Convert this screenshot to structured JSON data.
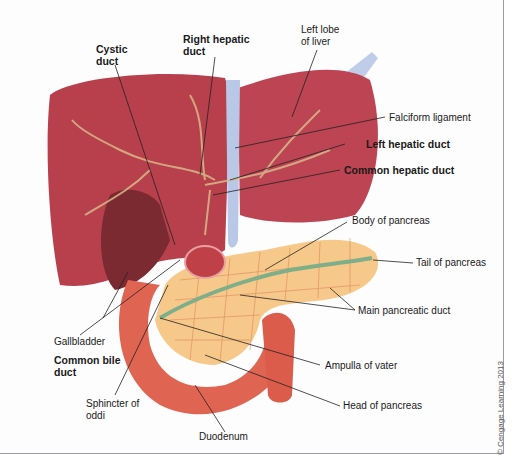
{
  "diagram": {
    "colors": {
      "liver": "#b8404c",
      "liver_dark": "#8e2a36",
      "gallbladder": "#7a2a30",
      "ligament": "#b9c8e6",
      "pancreas": "#f6c98a",
      "pancreas_lobule_line": "#e0805a",
      "duct": "#7fae8a",
      "duodenum": "#e06452",
      "vessel": "#d8b98a",
      "label_text": "#1a1a1a"
    },
    "labels": {
      "cystic_duct": "Cystic\nduct",
      "cystic_duct_l1": "Cystic",
      "cystic_duct_l2": "duct",
      "right_hepatic_duct_l1": "Right hepatic",
      "right_hepatic_duct_l2": "duct",
      "left_lobe_l1": "Left lobe",
      "left_lobe_l2": "of liver",
      "falciform_ligament": "Falciform ligament",
      "left_hepatic_duct": "Left hepatic duct",
      "common_hepatic_duct": "Common hepatic duct",
      "body_of_pancreas": "Body of pancreas",
      "tail_of_pancreas": "Tail of pancreas",
      "main_pancreatic_duct": "Main pancreatic duct",
      "gallbladder": "Gallbladder",
      "common_bile_duct_l1": "Common bile",
      "common_bile_duct_l2": "duct",
      "ampulla_of_vater": "Ampulla of vater",
      "sphincter_l1": "Sphincter of",
      "sphincter_l2": "oddi",
      "head_of_pancreas": "Head of pancreas",
      "duodenum": "Duodenum"
    },
    "copyright": "© Cengage Learning 2013"
  }
}
